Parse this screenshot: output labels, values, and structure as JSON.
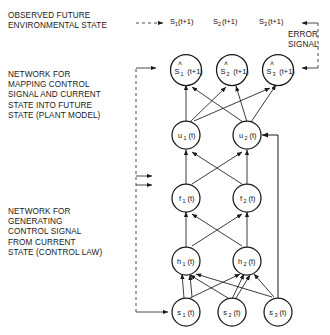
{
  "figure": {
    "type": "neural-network-control-diagram",
    "labels": {
      "observed_future": "OBSERVED FUTURE\nENVIRONMENTAL STATE",
      "plant_model": "NETWORK FOR\nMAPPING CONTROL\nSIGNAL AND CURRENT\nSTATE INTO FUTURE\nSTATE (PLANT MODEL)",
      "control_law": "NETWORK FOR\nGENERATING\nCONTROL SIGNAL\nFROM CURRENT\nSTATE (CONTROL LAW)",
      "error_signal": "ERROR\nSIGNAL"
    },
    "target_row": [
      {
        "base": "S",
        "sub": "1",
        "arg": "(t+1)"
      },
      {
        "base": "S",
        "sub": "2",
        "arg": "(t+1)"
      },
      {
        "base": "S",
        "sub": "3",
        "arg": "(t+1)"
      }
    ],
    "layers": [
      {
        "id": "prediction",
        "hat": true,
        "nodes": [
          {
            "base": "S",
            "sub": "1",
            "arg": "(t+1)"
          },
          {
            "base": "S",
            "sub": "2",
            "arg": "(t+1)"
          },
          {
            "base": "S",
            "sub": "3",
            "arg": "(t+1)"
          }
        ]
      },
      {
        "id": "control-output",
        "hat": false,
        "nodes": [
          {
            "base": "u",
            "sub": "1",
            "arg": "(t)"
          },
          {
            "base": "u",
            "sub": "2",
            "arg": "(t)"
          }
        ]
      },
      {
        "id": "hidden-f",
        "hat": false,
        "nodes": [
          {
            "base": "f",
            "sub": "1",
            "arg": "(t)"
          },
          {
            "base": "f",
            "sub": "2",
            "arg": "(t)"
          }
        ]
      },
      {
        "id": "hidden-h",
        "hat": false,
        "nodes": [
          {
            "base": "h",
            "sub": "1",
            "arg": "(t)"
          },
          {
            "base": "h",
            "sub": "2",
            "arg": "(t)"
          }
        ]
      },
      {
        "id": "state-input",
        "hat": false,
        "nodes": [
          {
            "base": "s",
            "sub": "1",
            "arg": "(t)"
          },
          {
            "base": "s",
            "sub": "2",
            "arg": "(t)"
          },
          {
            "base": "s",
            "sub": "3",
            "arg": "(t)"
          }
        ]
      }
    ],
    "colors": {
      "stroke": "#1a1a1a",
      "text": "#1a1a1a",
      "background": "#ffffff"
    }
  }
}
